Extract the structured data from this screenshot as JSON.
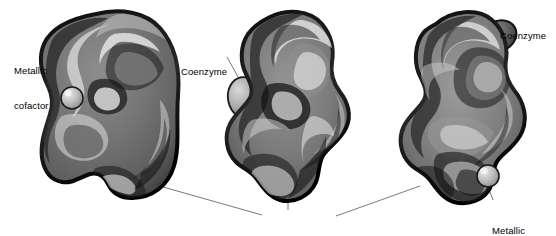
{
  "figure": {
    "title": "",
    "background_color": "#ffffff",
    "outline_color": "#1a1a1a",
    "body_fill_color": "#737373",
    "body_shadow_color": "#2b2b2b",
    "highlight_color": "#ffffff",
    "cofactor_fill_color": "#b5b5b5",
    "coenzyme_fill_color": "#9a9a9a",
    "leader_line_color": "#555555"
  },
  "labels": {
    "metallic_cofactor_left": {
      "line1": "Metallic",
      "line2": "cofactor"
    },
    "coenzyme_middle": {
      "line1": "Coenzyme"
    },
    "coenzyme_right": {
      "line1": "Coenzyme"
    },
    "metallic_cofactor_right": {
      "line1": "Metallic",
      "line2": "cofactor"
    },
    "apoenzymes": {
      "line1": "Apoenzymes"
    }
  },
  "structures": [
    {
      "name": "apoenzyme-left",
      "shape": "kidney",
      "attachments": [
        {
          "type": "metallic-cofactor",
          "shape": "sphere",
          "position": "left-notch"
        }
      ]
    },
    {
      "name": "apoenzyme-middle",
      "shape": "peanut",
      "attachments": [
        {
          "type": "coenzyme",
          "shape": "oval",
          "position": "upper-left"
        }
      ]
    },
    {
      "name": "apoenzyme-right",
      "shape": "peanut",
      "attachments": [
        {
          "type": "coenzyme",
          "shape": "oval",
          "position": "upper-right"
        },
        {
          "type": "metallic-cofactor",
          "shape": "sphere",
          "position": "lower-right"
        }
      ]
    }
  ],
  "leader_lines": [
    {
      "from": "metallic-cofactor-left-label",
      "to": "sphere-left"
    },
    {
      "from": "coenzyme-middle-label",
      "to": "oval-middle"
    },
    {
      "from": "coenzyme-right-label",
      "to": "oval-right"
    },
    {
      "from": "metallic-cofactor-right-label",
      "to": "sphere-right"
    },
    {
      "from": "apoenzymes-label",
      "to": "apoenzyme-left-bottom"
    },
    {
      "from": "apoenzymes-label",
      "to": "apoenzyme-middle-bottom"
    },
    {
      "from": "apoenzymes-label",
      "to": "apoenzyme-right-bottom"
    }
  ]
}
